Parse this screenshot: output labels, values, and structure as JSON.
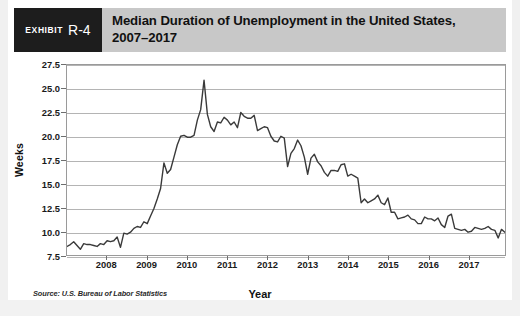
{
  "exhibit": {
    "word": "Exhibit",
    "number": "R-4"
  },
  "header": {
    "title": "Median Duration of Unemployment in the United States, 2007–2017"
  },
  "source_note": "Source: U.S. Bureau of Labor Statistics",
  "colors": {
    "header_band": "#c8c8c8",
    "exhibit_box": "#1d1d1d",
    "line": "#3a3a3a",
    "grid": "#b4b4b4",
    "plot_border": "#9a9a9a",
    "page_background": "#ffffff"
  },
  "chart_data": {
    "type": "line",
    "title": "Median Duration of Unemployment in the United States, 2007–2017",
    "xlabel": "Year",
    "ylabel": "Weeks",
    "ylim": [
      7.5,
      27.5
    ],
    "yticks": [
      7.5,
      10.0,
      12.5,
      15.0,
      17.5,
      20.0,
      22.5,
      25.0,
      27.5
    ],
    "ytick_labels": [
      "7.5",
      "10.0",
      "12.5",
      "15.0",
      "17.5",
      "20.0",
      "22.5",
      "25.0",
      "27.5"
    ],
    "xlim": [
      2007.0,
      2017.92
    ],
    "xticks": [
      2008,
      2009,
      2010,
      2011,
      2012,
      2013,
      2014,
      2015,
      2016,
      2017
    ],
    "xtick_labels": [
      "2008",
      "2009",
      "2010",
      "2011",
      "2012",
      "2013",
      "2014",
      "2015",
      "2016",
      "2017"
    ],
    "grid": "horizontal",
    "legend": null,
    "annotations": [],
    "series": [
      {
        "name": "Median duration of unemployment (weeks)",
        "units": "weeks",
        "frequency": "monthly",
        "x": [
          2007.0,
          2007.083,
          2007.167,
          2007.25,
          2007.333,
          2007.417,
          2007.5,
          2007.583,
          2007.667,
          2007.75,
          2007.833,
          2007.917,
          2008.0,
          2008.083,
          2008.167,
          2008.25,
          2008.333,
          2008.417,
          2008.5,
          2008.583,
          2008.667,
          2008.75,
          2008.833,
          2008.917,
          2009.0,
          2009.083,
          2009.167,
          2009.25,
          2009.333,
          2009.417,
          2009.5,
          2009.583,
          2009.667,
          2009.75,
          2009.833,
          2009.917,
          2010.0,
          2010.083,
          2010.167,
          2010.25,
          2010.333,
          2010.417,
          2010.5,
          2010.583,
          2010.667,
          2010.75,
          2010.833,
          2010.917,
          2011.0,
          2011.083,
          2011.167,
          2011.25,
          2011.333,
          2011.417,
          2011.5,
          2011.583,
          2011.667,
          2011.75,
          2011.833,
          2011.917,
          2012.0,
          2012.083,
          2012.167,
          2012.25,
          2012.333,
          2012.417,
          2012.5,
          2012.583,
          2012.667,
          2012.75,
          2012.833,
          2012.917,
          2013.0,
          2013.083,
          2013.167,
          2013.25,
          2013.333,
          2013.417,
          2013.5,
          2013.583,
          2013.667,
          2013.75,
          2013.833,
          2013.917,
          2014.0,
          2014.083,
          2014.167,
          2014.25,
          2014.333,
          2014.417,
          2014.5,
          2014.583,
          2014.667,
          2014.75,
          2014.833,
          2014.917,
          2015.0,
          2015.083,
          2015.167,
          2015.25,
          2015.333,
          2015.417,
          2015.5,
          2015.583,
          2015.667,
          2015.75,
          2015.833,
          2015.917,
          2016.0,
          2016.083,
          2016.167,
          2016.25,
          2016.333,
          2016.417,
          2016.5,
          2016.583,
          2016.667,
          2016.75,
          2016.833,
          2016.917,
          2017.0,
          2017.083,
          2017.167,
          2017.25,
          2017.333,
          2017.417,
          2017.5,
          2017.583,
          2017.667,
          2017.75,
          2017.833,
          2017.917
        ],
        "values": [
          8.4,
          8.6,
          8.9,
          8.5,
          8.1,
          8.7,
          8.6,
          8.6,
          8.5,
          8.4,
          8.7,
          8.6,
          9.0,
          8.9,
          9.0,
          9.4,
          8.3,
          9.8,
          9.7,
          9.9,
          10.3,
          10.5,
          10.4,
          11.0,
          10.8,
          11.6,
          12.4,
          13.4,
          14.5,
          17.2,
          16.1,
          16.5,
          17.8,
          19.1,
          20.0,
          20.1,
          19.9,
          19.9,
          20.1,
          21.7,
          22.8,
          25.9,
          22.3,
          21.0,
          20.5,
          21.5,
          21.4,
          22.0,
          21.7,
          21.2,
          21.5,
          20.9,
          22.5,
          22.1,
          21.9,
          21.9,
          22.2,
          20.6,
          20.8,
          21.0,
          20.9,
          20.0,
          19.5,
          19.4,
          20.0,
          19.8,
          16.8,
          18.2,
          18.7,
          19.6,
          19.0,
          17.8,
          16.0,
          17.7,
          18.1,
          17.3,
          16.9,
          16.2,
          15.8,
          16.4,
          16.4,
          16.3,
          17.0,
          17.1,
          15.8,
          16.0,
          15.8,
          15.6,
          13.0,
          13.4,
          13.0,
          13.2,
          13.4,
          13.8,
          13.0,
          12.8,
          13.5,
          12.0,
          12.0,
          11.3,
          11.4,
          11.5,
          11.7,
          11.3,
          11.2,
          10.8,
          10.8,
          11.5,
          11.3,
          11.3,
          11.1,
          11.4,
          10.7,
          10.4,
          11.6,
          11.8,
          10.3,
          10.2,
          10.1,
          10.2,
          9.9,
          10.0,
          10.4,
          10.3,
          10.2,
          10.3,
          10.5,
          10.2,
          10.1,
          9.3,
          10.2,
          9.9
        ]
      }
    ]
  }
}
